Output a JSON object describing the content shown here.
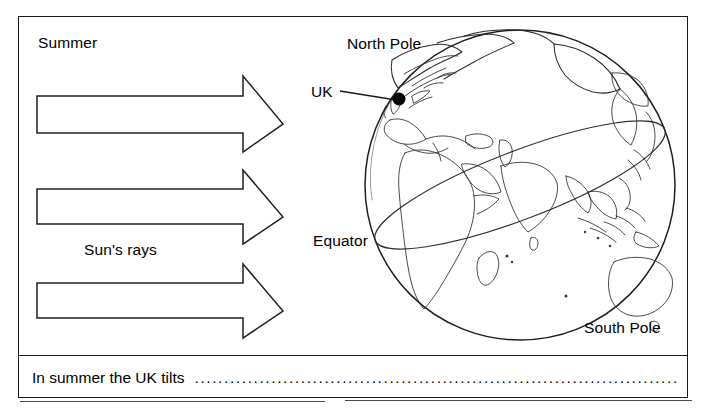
{
  "worksheet": {
    "title": "Summer season diagram worksheet",
    "labels": {
      "summer": "Summer",
      "suns_rays": "Sun's rays",
      "north_pole": "North Pole",
      "uk": "UK",
      "equator": "Equator",
      "south_pole": "South Pole"
    },
    "answer": {
      "prompt": "In summer the UK tilts",
      "dots": "................................................................................................................."
    },
    "colors": {
      "ink": "#1a1a1a",
      "paper": "#ffffff",
      "coastline": "#2a2a2a",
      "marker": "#080808"
    },
    "icons": {
      "ray_arrow": "right-arrow-icon",
      "globe": "globe-icon",
      "uk_marker": "map-pin-dot-icon"
    },
    "arrows": [
      {
        "name": "sun-ray-arrow-top",
        "order": 1
      },
      {
        "name": "sun-ray-arrow-middle",
        "order": 2
      },
      {
        "name": "sun-ray-arrow-bottom",
        "order": 3
      }
    ]
  }
}
